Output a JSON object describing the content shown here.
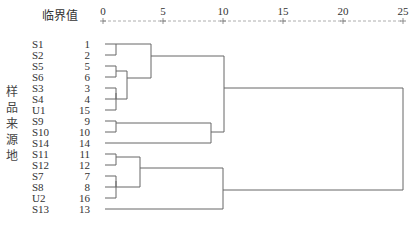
{
  "header": {
    "title": "临界值"
  },
  "y_axis_label": [
    "样",
    "品",
    "来",
    "源",
    "地"
  ],
  "axis": {
    "ticks": [
      0,
      5,
      10,
      15,
      20,
      25
    ]
  },
  "samples": [
    {
      "name": "S1",
      "id": "1"
    },
    {
      "name": "S2",
      "id": "2"
    },
    {
      "name": "S5",
      "id": "5"
    },
    {
      "name": "S6",
      "id": "6"
    },
    {
      "name": "S3",
      "id": "3"
    },
    {
      "name": "S4",
      "id": "4"
    },
    {
      "name": "U1",
      "id": "15"
    },
    {
      "name": "S9",
      "id": "9"
    },
    {
      "name": "S10",
      "id": "10"
    },
    {
      "name": "S14",
      "id": "14"
    },
    {
      "name": "S11",
      "id": "11"
    },
    {
      "name": "S12",
      "id": "12"
    },
    {
      "name": "S7",
      "id": "7"
    },
    {
      "name": "S8",
      "id": "8"
    },
    {
      "name": "U2",
      "id": "16"
    },
    {
      "name": "S13",
      "id": "13"
    }
  ],
  "merges": [
    {
      "a": [
        "S1"
      ],
      "b": [
        "S2"
      ],
      "distance": 1
    },
    {
      "a": [
        "S5"
      ],
      "b": [
        "S6"
      ],
      "distance": 1
    },
    {
      "a": [
        "S3"
      ],
      "b": [
        "S4"
      ],
      "distance": 1
    },
    {
      "a": [
        "S3",
        "S4"
      ],
      "b": [
        "U1"
      ],
      "distance": 1
    },
    {
      "a": [
        "S5",
        "S6"
      ],
      "b": [
        "S3",
        "S4",
        "U1"
      ],
      "distance": 2
    },
    {
      "a": [
        "S1",
        "S2"
      ],
      "b": [
        "S5",
        "S6",
        "S3",
        "S4",
        "U1"
      ],
      "distance": 4
    },
    {
      "a": [
        "S9"
      ],
      "b": [
        "S10"
      ],
      "distance": 1
    },
    {
      "a": [
        "S9",
        "S10"
      ],
      "b": [
        "S14"
      ],
      "distance": 9
    },
    {
      "a": [
        "S1",
        "S2",
        "S5",
        "S6",
        "S3",
        "S4",
        "U1"
      ],
      "b": [
        "S9",
        "S10",
        "S14"
      ],
      "distance": 10
    },
    {
      "a": [
        "S11"
      ],
      "b": [
        "S12"
      ],
      "distance": 1
    },
    {
      "a": [
        "S7"
      ],
      "b": [
        "S8"
      ],
      "distance": 1
    },
    {
      "a": [
        "S7",
        "S8"
      ],
      "b": [
        "U2"
      ],
      "distance": 1
    },
    {
      "a": [
        "S11",
        "S12"
      ],
      "b": [
        "S7",
        "S8",
        "U2"
      ],
      "distance": 3
    },
    {
      "a": [
        "S11",
        "S12",
        "S7",
        "S8",
        "U2"
      ],
      "b": [
        "S13"
      ],
      "distance": 10
    },
    {
      "a": [
        "cluster_top"
      ],
      "b": [
        "cluster_bottom"
      ],
      "distance": 25
    }
  ],
  "colors": {
    "line": "#666666",
    "text": "#333333",
    "axis": "#888888"
  }
}
